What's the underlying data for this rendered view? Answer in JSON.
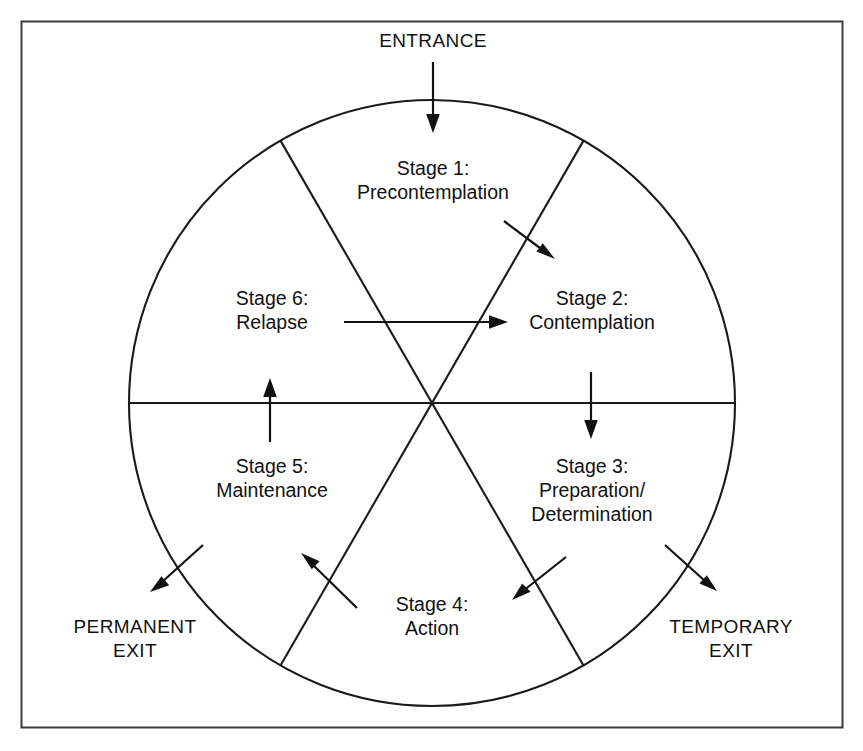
{
  "figure": {
    "frame_color": "#3b3b3b",
    "line_color": "#111111",
    "background": "#ffffff"
  },
  "entrance": {
    "label": "ENTRANCE"
  },
  "exits": [
    {
      "id": "permanent-exit",
      "line1": "PERMANENT",
      "line2": "EXIT"
    },
    {
      "id": "temporary-exit",
      "line1": "TEMPORARY",
      "line2": "EXIT"
    }
  ],
  "stages": [
    {
      "number": "Stage 1:",
      "name": "Precontemplation",
      "line2": "",
      "sector": 1
    },
    {
      "number": "Stage 2:",
      "name": "Contemplation",
      "line2": "",
      "sector": 2
    },
    {
      "number": "Stage 3:",
      "name": "Preparation/",
      "line2": "Determination",
      "sector": 3
    },
    {
      "number": "Stage 4:",
      "name": "Action",
      "line2": "",
      "sector": 4
    },
    {
      "number": "Stage 5:",
      "name": "Maintenance",
      "line2": "",
      "sector": 5
    },
    {
      "number": "Stage 6:",
      "name": "Relapse",
      "line2": "",
      "sector": 6
    }
  ],
  "arrows": [
    {
      "id": "entrance-arrow",
      "from": "ENTRANCE",
      "to": "Stage 1: Precontemplation"
    },
    {
      "id": "stage1-to-stage2-arrow",
      "from": "Stage 1: Precontemplation",
      "to": "Stage 2: Contemplation"
    },
    {
      "id": "stage2-to-stage3-arrow",
      "from": "Stage 2: Contemplation",
      "to": "Stage 3: Preparation/Determination"
    },
    {
      "id": "stage3-to-stage4-arrow",
      "from": "Stage 3: Preparation/Determination",
      "to": "Stage 4: Action"
    },
    {
      "id": "stage4-to-stage5-arrow",
      "from": "Stage 4: Action",
      "to": "Stage 5: Maintenance"
    },
    {
      "id": "stage5-to-stage6-arrow",
      "from": "Stage 5: Maintenance",
      "to": "Stage 6: Relapse"
    },
    {
      "id": "stage6-to-stage2-arrow",
      "from": "Stage 6: Relapse",
      "to": "Stage 2: Contemplation"
    },
    {
      "id": "permanent-exit-arrow",
      "from": "Stage 5: Maintenance",
      "to": "PERMANENT EXIT"
    },
    {
      "id": "temporary-exit-arrow",
      "from": "Stage 3: Preparation/Determination",
      "to": "TEMPORARY EXIT"
    }
  ]
}
